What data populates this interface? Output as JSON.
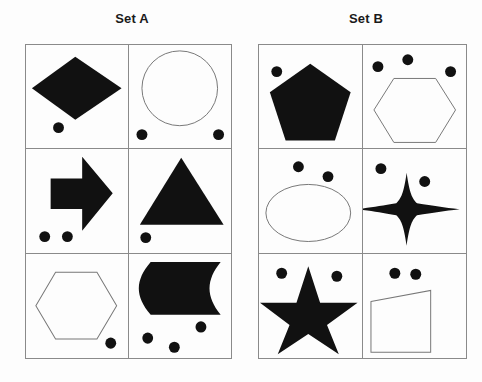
{
  "page": {
    "background_color": "#fdfdfd",
    "shape_fill_color": "#111111",
    "outline_stroke_color": "#777777",
    "grid_border_color": "#8a8a8a",
    "dot_color": "#111111"
  },
  "sets": [
    {
      "id": "set-a",
      "title": "Set A",
      "cells": [
        {
          "position": "top-left",
          "shape": "diamond",
          "shape_style": "filled",
          "dot_count": 1,
          "dots": [
            {
              "cx": 33,
              "cy": 84,
              "r": 5.5
            }
          ]
        },
        {
          "position": "top-right",
          "shape": "circle",
          "shape_style": "outline",
          "dot_count": 2,
          "dots": [
            {
              "cx": 13,
              "cy": 91,
              "r": 5.5
            },
            {
              "cx": 90,
              "cy": 91,
              "r": 5.5
            }
          ]
        },
        {
          "position": "middle-left",
          "shape": "arrow-right",
          "shape_style": "filled",
          "dot_count": 2,
          "dots": [
            {
              "cx": 19,
              "cy": 89,
              "r": 5.5
            },
            {
              "cx": 42,
              "cy": 89,
              "r": 5.5
            }
          ]
        },
        {
          "position": "middle-right",
          "shape": "triangle",
          "shape_style": "filled",
          "dot_count": 1,
          "dots": [
            {
              "cx": 17,
              "cy": 90,
              "r": 5.5
            }
          ]
        },
        {
          "position": "bottom-left",
          "shape": "hexagon",
          "shape_style": "outline",
          "dot_count": 1,
          "dots": [
            {
              "cx": 86,
              "cy": 88,
              "r": 5.5
            }
          ]
        },
        {
          "position": "bottom-right",
          "shape": "rounded-rect-with-circular-bite",
          "shape_style": "filled",
          "dot_count": 3,
          "dots": [
            {
              "cx": 19,
              "cy": 83,
              "r": 5.5
            },
            {
              "cx": 46,
              "cy": 92,
              "r": 5.5
            },
            {
              "cx": 73,
              "cy": 72,
              "r": 5.5
            }
          ]
        }
      ]
    },
    {
      "id": "set-b",
      "title": "Set B",
      "cells": [
        {
          "position": "top-left",
          "shape": "pentagon",
          "shape_style": "filled",
          "dot_count": 1,
          "dots": [
            {
              "cx": 18,
              "cy": 27,
              "r": 5.5
            }
          ]
        },
        {
          "position": "top-right",
          "shape": "hexagon",
          "shape_style": "outline",
          "dot_count": 3,
          "dots": [
            {
              "cx": 15,
              "cy": 22,
              "r": 5.5
            },
            {
              "cx": 45,
              "cy": 15,
              "r": 5.5
            },
            {
              "cx": 88,
              "cy": 27,
              "r": 5.5
            }
          ]
        },
        {
          "position": "middle-left",
          "shape": "ellipse",
          "shape_style": "outline",
          "dot_count": 2,
          "dots": [
            {
              "cx": 40,
              "cy": 18,
              "r": 5.5
            },
            {
              "cx": 70,
              "cy": 28,
              "r": 5.5
            }
          ]
        },
        {
          "position": "middle-right",
          "shape": "four-pointed-star",
          "shape_style": "filled",
          "dot_count": 2,
          "dots": [
            {
              "cx": 18,
              "cy": 20,
              "r": 5.5
            },
            {
              "cx": 62,
              "cy": 33,
              "r": 5.5
            }
          ]
        },
        {
          "position": "bottom-left",
          "shape": "five-pointed-star",
          "shape_style": "filled",
          "dot_count": 2,
          "dots": [
            {
              "cx": 23,
              "cy": 19,
              "r": 5.5
            },
            {
              "cx": 79,
              "cy": 22,
              "r": 5.5
            }
          ]
        },
        {
          "position": "bottom-right",
          "shape": "trapezoid",
          "shape_style": "outline",
          "dot_count": 2,
          "dots": [
            {
              "cx": 32,
              "cy": 19,
              "r": 5.5
            },
            {
              "cx": 53,
              "cy": 20,
              "r": 5.5
            }
          ]
        }
      ]
    }
  ]
}
